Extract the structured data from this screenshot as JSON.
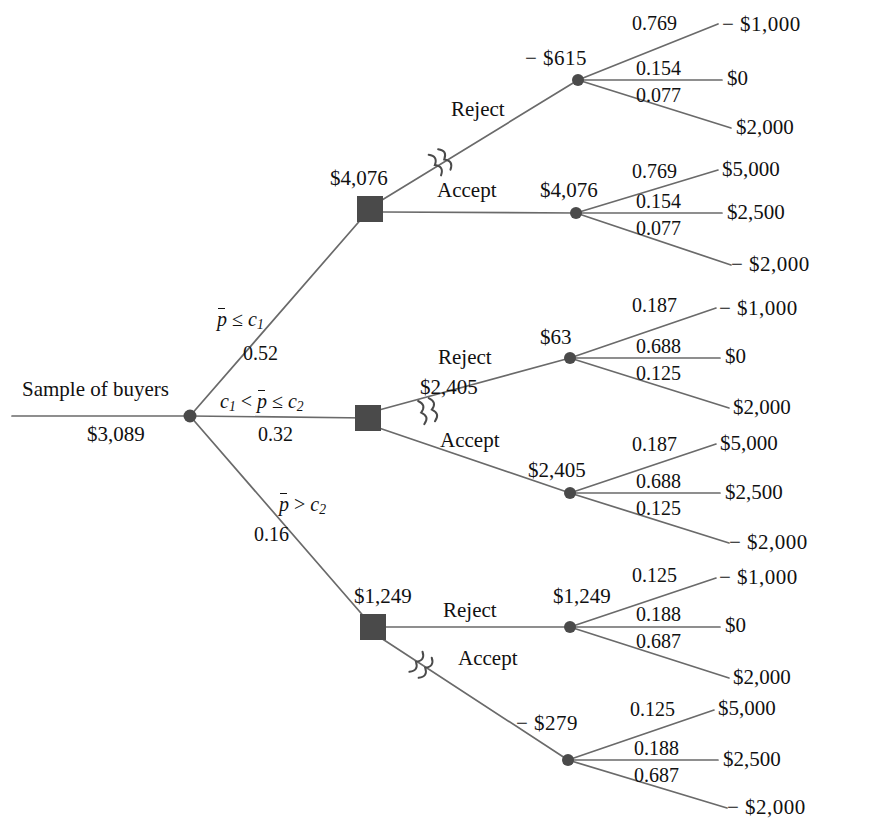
{
  "diagram": {
    "type": "decision-tree",
    "colors": {
      "line": "#6a6a6a",
      "node_fill": "#4a4a4a",
      "text": "#111111",
      "background": "#ffffff"
    }
  },
  "root": {
    "label": "Sample of buyers",
    "value": "$3,089",
    "node_type": "chance"
  },
  "branches": [
    {
      "id": "top",
      "condition_prefix": "p̄",
      "condition_text": "p̄ ≤ c₁",
      "probability": "0.52",
      "decision_value": "$4,076",
      "decision_node_type": "decision",
      "options": [
        {
          "action": "Reject",
          "chosen": false,
          "pruned": true,
          "value": "− $615",
          "probabilities": [
            "0.769",
            "0.154",
            "0.077"
          ],
          "outcomes": [
            "− $1,000",
            "$0",
            "$2,000"
          ]
        },
        {
          "action": "Accept",
          "chosen": true,
          "pruned": false,
          "value": "$4,076",
          "probabilities": [
            "0.769",
            "0.154",
            "0.077"
          ],
          "outcomes": [
            "$5,000",
            "$2,500",
            "− $2,000"
          ]
        }
      ]
    },
    {
      "id": "middle",
      "condition_text": "c₁ < p̄ ≤ c₂",
      "probability": "0.32",
      "decision_value": "$2,405",
      "decision_node_type": "decision",
      "options": [
        {
          "action": "Reject",
          "chosen": false,
          "pruned": true,
          "value": "$63",
          "probabilities": [
            "0.187",
            "0.688",
            "0.125"
          ],
          "outcomes": [
            "− $1,000",
            "$0",
            "$2,000"
          ]
        },
        {
          "action": "Accept",
          "chosen": true,
          "pruned": false,
          "value": "$2,405",
          "probabilities": [
            "0.187",
            "0.688",
            "0.125"
          ],
          "outcomes": [
            "$5,000",
            "$2,500",
            "− $2,000"
          ]
        }
      ]
    },
    {
      "id": "bottom",
      "condition_text": "p̄ > c₂",
      "probability": "0.16",
      "decision_value": "$1,249",
      "decision_node_type": "decision",
      "options": [
        {
          "action": "Reject",
          "chosen": true,
          "pruned": false,
          "value": "$1,249",
          "probabilities": [
            "0.125",
            "0.188",
            "0.687"
          ],
          "outcomes": [
            "− $1,000",
            "$0",
            "$2,000"
          ]
        },
        {
          "action": "Accept",
          "chosen": false,
          "pruned": true,
          "value": "− $279",
          "probabilities": [
            "0.125",
            "0.188",
            "0.687"
          ],
          "outcomes": [
            "$5,000",
            "$2,500",
            "− $2,000"
          ]
        }
      ]
    }
  ],
  "labels": {
    "top_reject_value": "− $615",
    "top_accept_value": "$4,076",
    "top_decision_value": "$4,076",
    "mid_reject_value": "$63",
    "mid_accept_value": "$2,405",
    "mid_decision_value": "$2,405",
    "bot_reject_value": "$1,249",
    "bot_accept_value": "− $279",
    "bot_decision_value": "$1,249",
    "prob_top_a": "0.769",
    "prob_top_b": "0.154",
    "prob_top_c": "0.077",
    "prob_mid_a": "0.187",
    "prob_mid_b": "0.688",
    "prob_mid_c": "0.125",
    "prob_bot_a": "0.125",
    "prob_bot_b": "0.188",
    "prob_bot_c": "0.687",
    "out_neg1000": "− $1,000",
    "out_zero": "$0",
    "out_2000": "$2,000",
    "out_5000": "$5,000",
    "out_2500": "$2,500",
    "out_neg2000": "− $2,000",
    "action_reject": "Reject",
    "action_accept": "Accept",
    "branch_prob_top": "0.52",
    "branch_prob_mid": "0.32",
    "branch_prob_bot": "0.16",
    "root_label": "Sample of buyers",
    "root_value": "$3,089"
  }
}
